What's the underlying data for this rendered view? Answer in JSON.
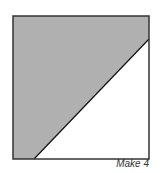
{
  "diagram": {
    "caption": "Make 4",
    "square": {
      "x": 13,
      "y": 16,
      "size": 136,
      "stroke": "#333333"
    },
    "shaded_region": {
      "fill": "#b0b0b0",
      "points": "13,16 149,16 149,39 34,159 13,159"
    },
    "diagonal": {
      "x1": 34,
      "y1": 159,
      "x2": 149,
      "y2": 39,
      "stroke": "#111111"
    },
    "unshaded_fill": "#ffffff"
  }
}
